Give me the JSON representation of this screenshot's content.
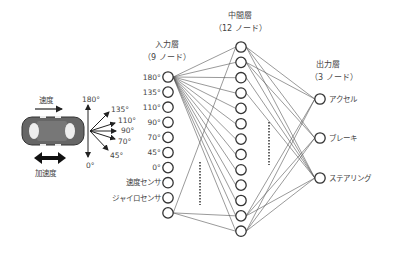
{
  "car": {
    "speed_label": "速度",
    "accel_label": "加速度",
    "body_color": "#666666"
  },
  "sensor_rays": {
    "up_label": "180°",
    "down_label": "0°",
    "angles": [
      "135°",
      "110°",
      "90°",
      "70°",
      "45°"
    ]
  },
  "input_layer": {
    "title": "入力層",
    "subtitle": "（9 ノード）",
    "labels": [
      "180°",
      "135°",
      "110°",
      "90°",
      "70°",
      "45°",
      "0°",
      "速度センサ",
      "ジャイロセンサ",
      ""
    ]
  },
  "hidden_layer": {
    "title": "中間層",
    "subtitle": "（12 ノード）",
    "node_count": 13
  },
  "output_layer": {
    "title": "出力層",
    "subtitle": "（3 ノード）",
    "labels": [
      "アクセル",
      "ブレーキ",
      "ステアリング"
    ]
  },
  "colors": {
    "line": "#555555",
    "node": "#333333",
    "text": "#444444"
  }
}
